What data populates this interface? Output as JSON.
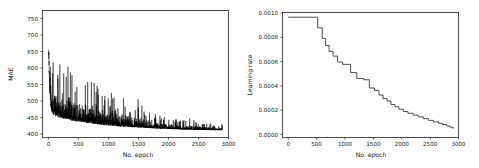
{
  "figure": {
    "background_color": "#ffffff",
    "panel_count": 2
  },
  "chart_data": [
    {
      "id": "mae-vs-epoch",
      "type": "line",
      "title": "",
      "xlabel": "No. epoch",
      "ylabel": "MAE",
      "xlim": [
        -100,
        3000
      ],
      "ylim": [
        380,
        765
      ],
      "xticks": [
        0,
        500,
        1000,
        1500,
        2000,
        2500,
        3000
      ],
      "xticklabels": [
        "0",
        "500",
        "1000",
        "1500",
        "2000",
        "2500",
        "3000"
      ],
      "yticks": [
        400,
        450,
        500,
        550,
        600,
        650,
        700,
        750
      ],
      "yticklabels": [
        "400",
        "450",
        "500",
        "550",
        "600",
        "650",
        "700",
        "750"
      ],
      "grid": false,
      "legend": null,
      "line_color": "#000000",
      "series": [
        {
          "name": "MAE",
          "description": "Noisy training loss trace decaying from ~750 to ~405 over 2900 epochs with dense high-frequency spikes",
          "x_start": 0,
          "x_end": 2900,
          "n_points": 2900,
          "envelope_upper": [
            [
              0,
              680
            ],
            [
              20,
              748
            ],
            [
              40,
              700
            ],
            [
              60,
              672
            ],
            [
              100,
              640
            ],
            [
              150,
              620
            ],
            [
              200,
              600
            ],
            [
              300,
              580
            ],
            [
              350,
              615
            ],
            [
              400,
              570
            ],
            [
              500,
              560
            ],
            [
              600,
              575
            ],
            [
              650,
              590
            ],
            [
              700,
              560
            ],
            [
              800,
              545
            ],
            [
              900,
              520
            ],
            [
              1000,
              505
            ],
            [
              1100,
              530
            ],
            [
              1200,
              490
            ],
            [
              1300,
              510
            ],
            [
              1400,
              480
            ],
            [
              1500,
              500
            ],
            [
              1600,
              470
            ],
            [
              1700,
              455
            ],
            [
              1800,
              450
            ],
            [
              2000,
              440
            ],
            [
              2200,
              435
            ],
            [
              2400,
              440
            ],
            [
              2600,
              425
            ],
            [
              2900,
              420
            ]
          ],
          "envelope_lower": [
            [
              0,
              640
            ],
            [
              20,
              520
            ],
            [
              40,
              470
            ],
            [
              60,
              452
            ],
            [
              100,
              445
            ],
            [
              200,
              438
            ],
            [
              400,
              430
            ],
            [
              600,
              425
            ],
            [
              800,
              420
            ],
            [
              1000,
              416
            ],
            [
              1200,
              413
            ],
            [
              1500,
              410
            ],
            [
              1800,
              407
            ],
            [
              2100,
              405
            ],
            [
              2400,
              403
            ],
            [
              2900,
              402
            ]
          ],
          "final_value": 405,
          "max_value": 750,
          "min_value": 400
        }
      ]
    },
    {
      "id": "learning-rate-schedule",
      "type": "line",
      "title": "",
      "xlabel": "No. epoch",
      "ylabel": "Learning rate",
      "xlim": [
        -100,
        3000
      ],
      "ylim": [
        -2e-05,
        0.00104
      ],
      "xticks": [
        0,
        500,
        1000,
        1500,
        2000,
        2500,
        3000
      ],
      "xticklabels": [
        "0",
        "500",
        "1000",
        "1500",
        "2000",
        "2500",
        "3000"
      ],
      "yticks": [
        0.0,
        0.0002,
        0.0004,
        0.0006,
        0.0008,
        0.001
      ],
      "yticklabels": [
        "0.0000",
        "0.0002",
        "0.0004",
        "0.0006",
        "0.0008",
        "0.0010"
      ],
      "grid": false,
      "legend": null,
      "line_color": "#3a3a3a",
      "series": [
        {
          "name": "Learning rate",
          "description": "Step-decay learning-rate schedule: constant 0.001 until epoch ~520, then discrete decreasing steps flattening toward ~0.00006",
          "step_points": [
            [
              0,
              0.001
            ],
            [
              520,
              0.001
            ],
            [
              520,
              0.00091
            ],
            [
              600,
              0.00091
            ],
            [
              600,
              0.00082
            ],
            [
              660,
              0.00082
            ],
            [
              660,
              0.00076
            ],
            [
              720,
              0.00076
            ],
            [
              720,
              0.00071
            ],
            [
              790,
              0.00071
            ],
            [
              790,
              0.00067
            ],
            [
              870,
              0.00067
            ],
            [
              870,
              0.00062
            ],
            [
              960,
              0.00062
            ],
            [
              960,
              0.0006
            ],
            [
              1100,
              0.0006
            ],
            [
              1100,
              0.00053
            ],
            [
              1210,
              0.00053
            ],
            [
              1210,
              0.00048
            ],
            [
              1330,
              0.00048
            ],
            [
              1330,
              0.00047
            ],
            [
              1430,
              0.00047
            ],
            [
              1430,
              0.0004
            ],
            [
              1520,
              0.0004
            ],
            [
              1520,
              0.00038
            ],
            [
              1600,
              0.00038
            ],
            [
              1600,
              0.00034
            ],
            [
              1670,
              0.00034
            ],
            [
              1670,
              0.00031
            ],
            [
              1740,
              0.00031
            ],
            [
              1740,
              0.00029
            ],
            [
              1810,
              0.00029
            ],
            [
              1810,
              0.00026
            ],
            [
              1880,
              0.00026
            ],
            [
              1880,
              0.00024
            ],
            [
              1950,
              0.00024
            ],
            [
              1950,
              0.00022
            ],
            [
              2030,
              0.00022
            ],
            [
              2030,
              0.0002
            ],
            [
              2110,
              0.0002
            ],
            [
              2110,
              0.000185
            ],
            [
              2200,
              0.000185
            ],
            [
              2200,
              0.00017
            ],
            [
              2290,
              0.00017
            ],
            [
              2290,
              0.000155
            ],
            [
              2380,
              0.000155
            ],
            [
              2380,
              0.00014
            ],
            [
              2470,
              0.00014
            ],
            [
              2470,
              0.000125
            ],
            [
              2560,
              0.000125
            ],
            [
              2560,
              0.000112
            ],
            [
              2650,
              0.000112
            ],
            [
              2650,
              0.0001
            ],
            [
              2720,
              0.0001
            ],
            [
              2720,
              9e-05
            ],
            [
              2790,
              9e-05
            ],
            [
              2790,
              7.8e-05
            ],
            [
              2850,
              7.8e-05
            ],
            [
              2850,
              6.8e-05
            ],
            [
              2900,
              6.8e-05
            ],
            [
              2900,
              6e-05
            ],
            [
              2920,
              6e-05
            ]
          ],
          "initial_value": 0.001,
          "final_value": 6e-05
        }
      ]
    }
  ]
}
